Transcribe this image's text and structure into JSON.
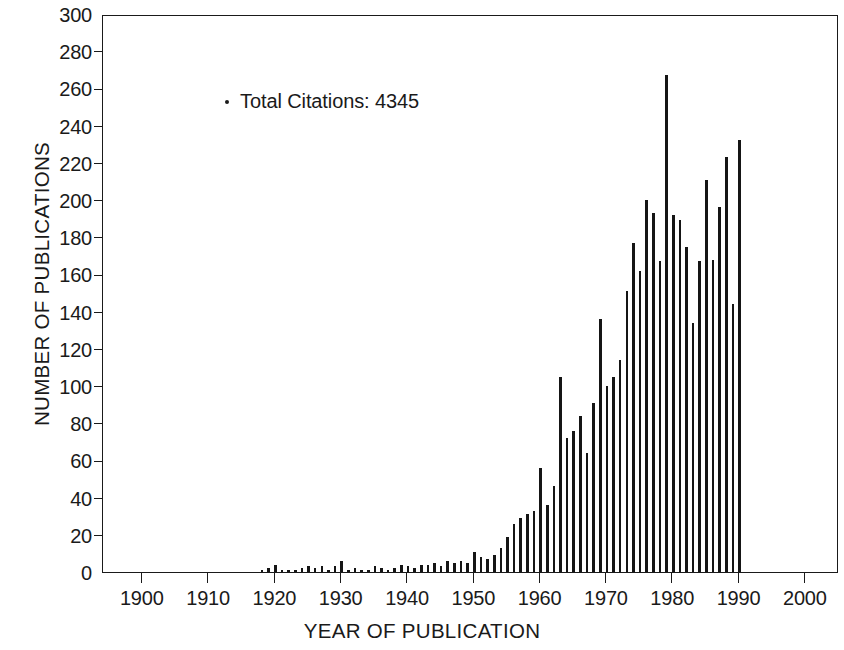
{
  "chart_data": {
    "type": "bar",
    "title": "",
    "xlabel": "YEAR OF PUBLICATION",
    "ylabel": "NUMBER OF PUBLICATIONS",
    "xlim": [
      1894,
      2005
    ],
    "ylim": [
      0,
      300
    ],
    "grid": false,
    "legend": null,
    "xticks": [
      1900,
      1910,
      1920,
      1930,
      1940,
      1950,
      1960,
      1970,
      1980,
      1990,
      2000
    ],
    "xtick_labels": [
      "1900",
      "1910",
      "1920",
      "1930",
      "1940",
      "1950",
      "1960",
      "1970",
      "1980",
      "1990",
      "2000"
    ],
    "yticks": [
      0,
      20,
      40,
      60,
      80,
      100,
      120,
      140,
      160,
      180,
      200,
      220,
      240,
      260,
      280,
      300
    ],
    "ytick_labels": [
      "0",
      "20",
      "40",
      "60",
      "80",
      "100",
      "120",
      "140",
      "160",
      "180",
      "200",
      "220",
      "240",
      "260",
      "280",
      "300"
    ],
    "annotations": [
      {
        "marker": "dot",
        "text": "Total Citations: 4345",
        "x": 1905,
        "y": 272
      }
    ],
    "bar_color": "#151515",
    "x": [
      1918,
      1919,
      1920,
      1921,
      1922,
      1923,
      1924,
      1925,
      1926,
      1927,
      1928,
      1929,
      1930,
      1931,
      1932,
      1933,
      1934,
      1935,
      1936,
      1937,
      1938,
      1939,
      1940,
      1941,
      1942,
      1943,
      1944,
      1945,
      1946,
      1947,
      1948,
      1949,
      1950,
      1951,
      1952,
      1953,
      1954,
      1955,
      1956,
      1957,
      1958,
      1959,
      1960,
      1961,
      1962,
      1963,
      1964,
      1965,
      1966,
      1967,
      1968,
      1969,
      1970,
      1971,
      1972,
      1973,
      1974,
      1975,
      1976,
      1977,
      1978,
      1979,
      1980,
      1981,
      1982,
      1983,
      1984,
      1985,
      1986,
      1987,
      1988,
      1989,
      1990
    ],
    "values": [
      1,
      2,
      4,
      1,
      1,
      1,
      2,
      3,
      2,
      3,
      1,
      3,
      6,
      1,
      2,
      1,
      1,
      3,
      2,
      1,
      2,
      4,
      3,
      2,
      4,
      4,
      5,
      3,
      6,
      5,
      6,
      5,
      11,
      8,
      7,
      9,
      13,
      19,
      26,
      29,
      31,
      33,
      56,
      36,
      46,
      105,
      72,
      76,
      84,
      64,
      91,
      136,
      100,
      105,
      114,
      151,
      177,
      162,
      200,
      193,
      167,
      267,
      192,
      189,
      175,
      134,
      167,
      211,
      168,
      196,
      223,
      144,
      232
    ]
  },
  "axis": {
    "y_title": "NUMBER OF PUBLICATIONS",
    "x_title": "YEAR OF PUBLICATION"
  }
}
